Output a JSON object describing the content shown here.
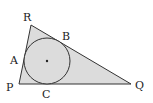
{
  "diagram": {
    "colors": {
      "fill": "#dcdcdc",
      "stroke": "#333333",
      "background": "#ffffff"
    },
    "vertices": {
      "P": {
        "label": "P",
        "x": 19,
        "y": 84
      },
      "Q": {
        "label": "Q",
        "x": 131,
        "y": 84
      },
      "R": {
        "label": "R",
        "x": 31,
        "y": 25
      }
    },
    "tangent_points": {
      "A": {
        "label": "A"
      },
      "B": {
        "label": "B"
      },
      "C": {
        "label": "C"
      }
    },
    "incircle": {
      "cx": 47,
      "cy": 61,
      "r": 23,
      "center_marked": true
    }
  }
}
